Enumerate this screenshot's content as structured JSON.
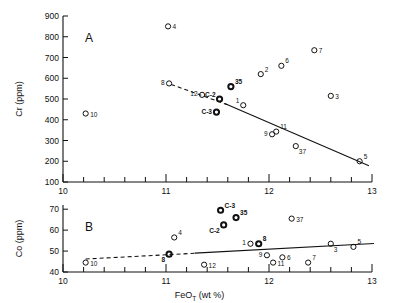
{
  "figure": {
    "panels": [
      "A",
      "B"
    ],
    "xlabel_main": "FeO",
    "xlabel_sub": "T",
    "xlabel_unit": "(wt %)"
  },
  "chart_data": [
    {
      "type": "scatter",
      "panel_label": "A",
      "title": "",
      "xlabel": "FeO_T (wt %)",
      "ylabel": "Cr (ppm)",
      "xlim": [
        10,
        13
      ],
      "ylim": [
        100,
        900
      ],
      "xticks": [
        10,
        11,
        12,
        13
      ],
      "xtick_labels": [
        "10",
        "11",
        "12",
        "13"
      ],
      "xminor_step": 0.2,
      "yticks": [
        100,
        200,
        300,
        400,
        500,
        600,
        700,
        800,
        900
      ],
      "ytick_labels": [
        "100",
        "200",
        "300",
        "400",
        "500",
        "600",
        "700",
        "800",
        "900"
      ],
      "grid": false,
      "legend": "none",
      "points": [
        {
          "label": "10",
          "x": 10.22,
          "y": 430,
          "label_pos": "right"
        },
        {
          "label": "4",
          "x": 11.02,
          "y": 850,
          "label_pos": "right"
        },
        {
          "label": "8",
          "x": 11.03,
          "y": 575,
          "label_pos": "left"
        },
        {
          "label": "12",
          "x": 11.35,
          "y": 520,
          "label_pos": "left"
        },
        {
          "label": "C-2",
          "x": 11.52,
          "y": 500,
          "label_pos": "upleft",
          "bold": true
        },
        {
          "label": "C-3",
          "x": 11.49,
          "y": 437,
          "label_pos": "left",
          "bold": true
        },
        {
          "label": "35",
          "x": 11.63,
          "y": 560,
          "label_pos": "upright",
          "bold": true
        },
        {
          "label": "1",
          "x": 11.75,
          "y": 470,
          "label_pos": "upleft"
        },
        {
          "label": "2",
          "x": 11.92,
          "y": 620,
          "label_pos": "upright"
        },
        {
          "label": "6",
          "x": 12.12,
          "y": 660,
          "label_pos": "upright"
        },
        {
          "label": "7",
          "x": 12.44,
          "y": 735,
          "label_pos": "right"
        },
        {
          "label": "3",
          "x": 12.6,
          "y": 515,
          "label_pos": "right"
        },
        {
          "label": "9",
          "x": 12.03,
          "y": 330,
          "label_pos": "left"
        },
        {
          "label": "11",
          "x": 12.07,
          "y": 343,
          "label_pos": "upright"
        },
        {
          "label": "37",
          "x": 12.26,
          "y": 273,
          "label_pos": "downright"
        },
        {
          "label": "5",
          "x": 12.88,
          "y": 200,
          "label_pos": "upright"
        }
      ],
      "trend_dashed": {
        "x1": 11.05,
        "y1": 570,
        "x2": 11.6,
        "y2": 472
      },
      "trend_solid": {
        "x1": 11.57,
        "y1": 478,
        "x2": 12.97,
        "y2": 178
      }
    },
    {
      "type": "scatter",
      "panel_label": "B",
      "title": "",
      "xlabel": "FeO_T (wt %)",
      "ylabel": "Co (ppm)",
      "xlim": [
        10,
        13
      ],
      "ylim": [
        40,
        72
      ],
      "xticks": [
        10,
        11,
        12,
        13
      ],
      "xtick_labels": [
        "10",
        "11",
        "12",
        "13"
      ],
      "xminor_step": 0.2,
      "yticks": [
        40,
        50,
        60,
        70
      ],
      "ytick_labels": [
        "40",
        "50",
        "60",
        "70"
      ],
      "grid": false,
      "legend": "none",
      "points": [
        {
          "label": "10",
          "x": 10.22,
          "y": 44.5,
          "label_pos": "right"
        },
        {
          "label": "8",
          "x": 11.03,
          "y": 48.5,
          "label_pos": "downleft",
          "bold": true
        },
        {
          "label": "4",
          "x": 11.08,
          "y": 56.5,
          "label_pos": "upright"
        },
        {
          "label": "12",
          "x": 11.37,
          "y": 43.5,
          "label_pos": "right"
        },
        {
          "label": "C-3",
          "x": 11.53,
          "y": 69.5,
          "label_pos": "upright",
          "bold": true
        },
        {
          "label": "C-2",
          "x": 11.56,
          "y": 62.5,
          "label_pos": "downleft",
          "bold": true
        },
        {
          "label": "35",
          "x": 11.68,
          "y": 66.0,
          "label_pos": "upright",
          "bold": true
        },
        {
          "label": "1",
          "x": 11.82,
          "y": 53.5,
          "label_pos": "left"
        },
        {
          "label": "8b",
          "x": 11.9,
          "y": 53.5,
          "label_pos": "upright",
          "bold": true
        },
        {
          "label": "9",
          "x": 11.98,
          "y": 48.0,
          "label_pos": "left"
        },
        {
          "label": "11",
          "x": 12.04,
          "y": 44.5,
          "label_pos": "right"
        },
        {
          "label": "37",
          "x": 12.22,
          "y": 65.5,
          "label_pos": "right"
        },
        {
          "label": "6",
          "x": 12.13,
          "y": 47.0,
          "label_pos": "right"
        },
        {
          "label": "7",
          "x": 12.38,
          "y": 44.5,
          "label_pos": "upright"
        },
        {
          "label": "3",
          "x": 12.6,
          "y": 53.5,
          "label_pos": "downright"
        },
        {
          "label": "5",
          "x": 12.82,
          "y": 52.0,
          "label_pos": "upright"
        }
      ],
      "trend_dashed": {
        "x1": 10.22,
        "y1": 46.2,
        "x2": 11.3,
        "y2": 49.0
      },
      "trend_solid": {
        "x1": 11.28,
        "y1": 49.0,
        "x2": 13.02,
        "y2": 53.6
      }
    }
  ]
}
